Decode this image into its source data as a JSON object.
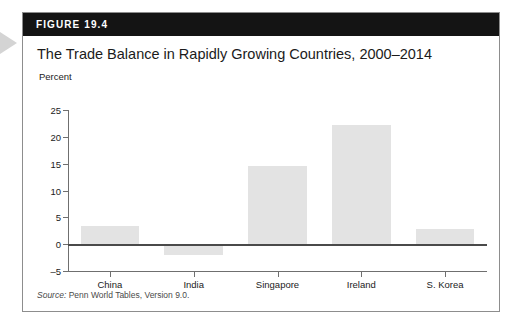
{
  "figure": {
    "header_label": "FIGURE 19.4",
    "title": "The Trade Balance in Rapidly Growing Countries, 2000–2014",
    "source": "Penn World Tables, Version 9.0.",
    "source_word": "Source:"
  },
  "chart_data": {
    "type": "bar",
    "title": "The Trade Balance in Rapidly Growing Countries, 2000–2014",
    "xlabel": "",
    "ylabel": "Percent",
    "categories": [
      "China",
      "India",
      "Singapore",
      "Ireland",
      "S. Korea"
    ],
    "values": [
      3.3,
      -2.1,
      14.6,
      22.2,
      2.8
    ],
    "ylim": [
      -5,
      25
    ],
    "yticks": [
      25,
      20,
      15,
      10,
      5,
      0,
      -5
    ],
    "ytick_labels": [
      "25",
      "20",
      "15",
      "10",
      "5",
      "0",
      "–5"
    ],
    "grid": false,
    "legend": false,
    "bar_color": "#e3e3e3",
    "axis_color": "#6f6f6f",
    "zero_line_color": "#4a4a4a"
  },
  "colors": {
    "header_bg": "#141414",
    "header_text": "#ffffff",
    "card_border": "#8d8d8d",
    "text": "#1b1b1b",
    "margin_arrow": "#d4d4d4"
  }
}
